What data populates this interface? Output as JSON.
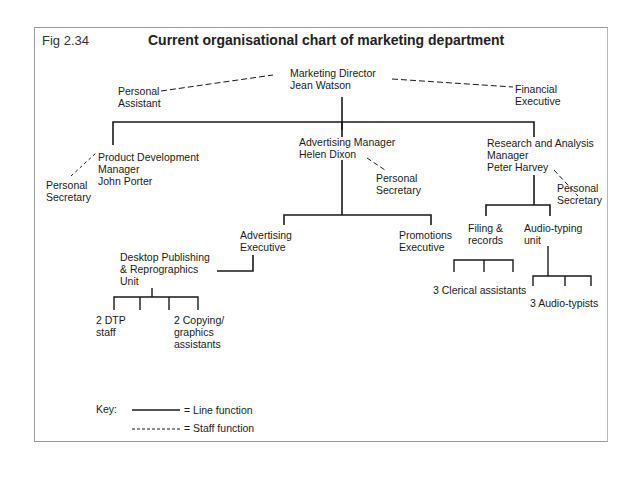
{
  "figure": {
    "label": "Fig 2.34",
    "title": "Current organisational chart of marketing department"
  },
  "nodes": {
    "director": {
      "line1": "Marketing Director",
      "line2": "Jean Watson"
    },
    "personal_assistant": {
      "line1": "Personal",
      "line2": "Assistant"
    },
    "financial_executive": {
      "line1": "Financial",
      "line2": "Executive"
    },
    "product_dev_manager": {
      "line1": "Product Development",
      "line2": "Manager",
      "line3": "John Porter"
    },
    "pd_secretary": {
      "line1": "Personal",
      "line2": "Secretary"
    },
    "advertising_manager": {
      "line1": "Advertising Manager",
      "line2": "Helen Dixon"
    },
    "am_secretary": {
      "line1": "Personal",
      "line2": "Secretary"
    },
    "research_manager": {
      "line1": "Research and Analysis",
      "line2": "Manager",
      "line3": "Peter Harvey"
    },
    "rm_secretary": {
      "line1": "Personal",
      "line2": "Secretary"
    },
    "advertising_executive": {
      "line1": "Advertising",
      "line2": "Executive"
    },
    "promotions_executive": {
      "line1": "Promotions",
      "line2": "Executive"
    },
    "dtp_unit": {
      "line1": "Desktop Publishing",
      "line2": "& Reprographics",
      "line3": "Unit"
    },
    "dtp_staff": {
      "line1": "2 DTP",
      "line2": "staff"
    },
    "copying_assistants": {
      "line1": "2 Copying/",
      "line2": "graphics",
      "line3": "assistants"
    },
    "filing_records": {
      "line1": "Filing &",
      "line2": "records"
    },
    "audio_typing_unit": {
      "line1": "Audio-typing",
      "line2": "unit"
    },
    "clerical_assistants": {
      "line1": "3 Clerical assistants"
    },
    "audio_typists": {
      "line1": "3 Audio-typists"
    }
  },
  "key": {
    "title": "Key:",
    "line_function": "= Line function",
    "staff_function": "= Staff function"
  },
  "colors": {
    "line": "#1a1a1a",
    "frame": "#9a9a9a"
  }
}
